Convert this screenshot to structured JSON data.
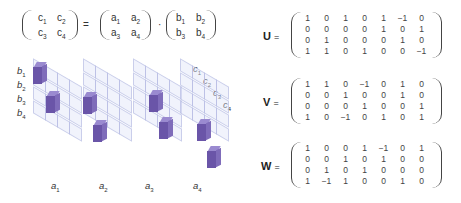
{
  "equation": {
    "lhs": {
      "cells": [
        [
          "c",
          "1"
        ],
        [
          "c",
          "2"
        ],
        [
          "c",
          "3"
        ],
        [
          "c",
          "4"
        ]
      ]
    },
    "equals": "=",
    "a_matrix": {
      "cells": [
        [
          "a",
          "1"
        ],
        [
          "a",
          "2"
        ],
        [
          "a",
          "3"
        ],
        [
          "a",
          "4"
        ]
      ]
    },
    "dot": "·",
    "b_matrix": {
      "cells": [
        [
          "b",
          "1"
        ],
        [
          "b",
          "2"
        ],
        [
          "b",
          "3"
        ],
        [
          "b",
          "4"
        ]
      ]
    }
  },
  "diagram": {
    "row_labels": [
      "b1",
      "b2",
      "b3",
      "b4"
    ],
    "row_label_parts": [
      [
        "b",
        "1"
      ],
      [
        "b",
        "2"
      ],
      [
        "b",
        "3"
      ],
      [
        "b",
        "4"
      ]
    ],
    "output_labels": [
      [
        "c",
        "1"
      ],
      [
        "c",
        "2"
      ],
      [
        "c",
        "3"
      ],
      [
        "c",
        "4"
      ]
    ],
    "slab_labels": [
      [
        "a",
        "1"
      ],
      [
        "a",
        "2"
      ],
      [
        "a",
        "3"
      ],
      [
        "a",
        "4"
      ]
    ],
    "cube_color": "#6a55a8",
    "ghost_color": "#e1e4f8"
  },
  "matrices": [
    {
      "name": "U",
      "equals": "=",
      "rows": [
        [
          "1",
          "0",
          "1",
          "0",
          "1",
          "−1",
          "0"
        ],
        [
          "0",
          "0",
          "0",
          "0",
          "1",
          "0",
          "1"
        ],
        [
          "0",
          "1",
          "0",
          "0",
          "0",
          "1",
          "0"
        ],
        [
          "1",
          "1",
          "0",
          "1",
          "0",
          "0",
          "−1"
        ]
      ]
    },
    {
      "name": "V",
      "equals": "=",
      "rows": [
        [
          "1",
          "1",
          "0",
          "−1",
          "0",
          "1",
          "0"
        ],
        [
          "0",
          "0",
          "1",
          "0",
          "0",
          "1",
          "0"
        ],
        [
          "0",
          "0",
          "0",
          "1",
          "0",
          "0",
          "1"
        ],
        [
          "1",
          "0",
          "−1",
          "0",
          "1",
          "0",
          "1"
        ]
      ]
    },
    {
      "name": "W",
      "equals": "=",
      "rows": [
        [
          "1",
          "0",
          "0",
          "1",
          "−1",
          "0",
          "1"
        ],
        [
          "0",
          "0",
          "1",
          "0",
          "1",
          "0",
          "0"
        ],
        [
          "0",
          "1",
          "0",
          "1",
          "0",
          "0",
          "0"
        ],
        [
          "1",
          "−1",
          "1",
          "0",
          "0",
          "1",
          "0"
        ]
      ]
    }
  ]
}
